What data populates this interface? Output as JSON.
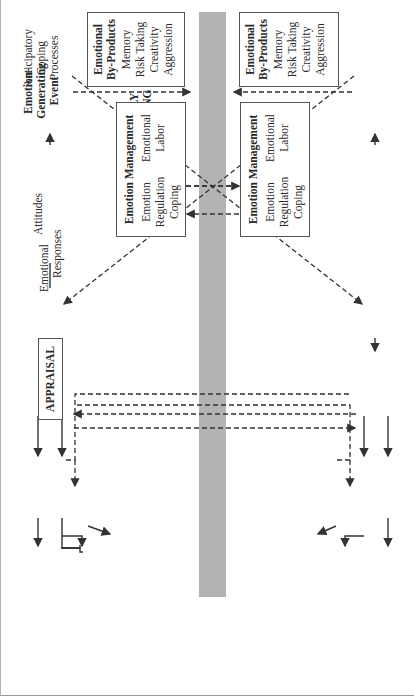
{
  "figure": {
    "rotation_deg": -90,
    "band_color": "#b3b3b3",
    "line_color": "#333333"
  },
  "family": {
    "setting_label": [
      "FAMILY",
      "SETTING"
    ],
    "anticipatory": [
      "Anticipatory",
      "Coping",
      "Processes"
    ],
    "event": [
      "Emotion-",
      "Generating",
      "Event"
    ],
    "appraisal": "APPRAISAL",
    "responses": [
      "Emotional",
      "Responses"
    ],
    "attitudes": "Attitudes",
    "attitude_behaviors": [
      "Attitude-Driven",
      "Behaviors"
    ],
    "affect_behaviors": [
      "Affect-Driven",
      "Behaviors"
    ],
    "emotion_management": {
      "title": "Emotion Management",
      "items": [
        "Emotion",
        "Regulation",
        "Coping",
        "Emotional",
        "Labor"
      ]
    },
    "byproducts": {
      "title": [
        "Emotional",
        "By-Products"
      ],
      "items": [
        "Memory",
        "Risk Taking",
        "Creativity",
        "Aggression"
      ]
    },
    "marker": "1"
  },
  "work": {
    "setting_label": [
      "WORK",
      "SETTING"
    ],
    "anticipatory": [
      "Anticipatory",
      "Coping",
      "Processes"
    ],
    "event": [
      "Emotion-",
      "Generating",
      "Event"
    ],
    "appraisal": "APPRAISAL",
    "responses": [
      "Emotional",
      "Responses"
    ],
    "attitudes": "Attitudes",
    "attitude_behaviors": [
      "Attitude-Driven",
      "Behaviors"
    ],
    "affect_behaviors": [
      "Affect-Driven",
      "Behaviors"
    ],
    "emotion_management": {
      "title": "Emotion Management",
      "items": [
        "Emotion",
        "Regulation",
        "Coping",
        "Emotional",
        "Labor"
      ]
    },
    "byproducts": {
      "title": [
        "Emotional",
        "By-Products"
      ],
      "items": [
        "Memory",
        "Risk Taking",
        "Creativity",
        "Aggression"
      ]
    },
    "marker": "2"
  },
  "crossover_markers": [
    "3",
    "4",
    "5",
    "5",
    "6"
  ],
  "stable": {
    "person": [
      "Stable",
      "Person",
      "Characteristics"
    ],
    "features": [
      "Stable",
      "Features"
    ],
    "environment": [
      "Stable",
      "Environment",
      "Characteristics"
    ]
  }
}
